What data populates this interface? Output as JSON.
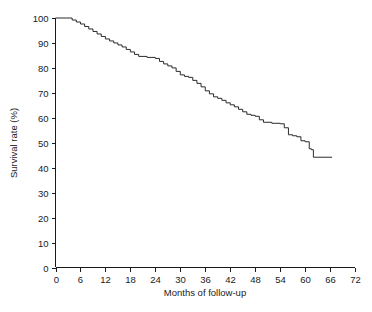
{
  "chart_data": {
    "type": "line",
    "title": "",
    "subtitle": "",
    "xlabel": "Months of follow-up",
    "ylabel": "Survival rate (%)",
    "xlim": [
      0,
      72
    ],
    "ylim": [
      0,
      100
    ],
    "xticks": [
      0,
      6,
      12,
      18,
      24,
      30,
      36,
      42,
      48,
      54,
      60,
      66,
      72
    ],
    "yticks": [
      0,
      10,
      20,
      30,
      40,
      50,
      60,
      70,
      80,
      90,
      100
    ],
    "xtick_labels": [
      "0",
      "6",
      "12",
      "18",
      "24",
      "30",
      "36",
      "42",
      "48",
      "54",
      "60",
      "66",
      "72"
    ],
    "ytick_labels": [
      "0",
      "10",
      "20",
      "30",
      "40",
      "50",
      "60",
      "70",
      "80",
      "90",
      "100"
    ],
    "grid": false,
    "legend": false,
    "legend_position": "none",
    "line_color": "#2b2b2b",
    "background_color": "#ffffff",
    "step_style": "post",
    "series": [
      {
        "name": "Survival",
        "x": [
          0,
          2.5,
          4,
          5,
          6,
          7,
          8,
          9,
          10,
          11,
          12,
          13,
          14,
          15,
          16,
          17,
          18,
          19,
          20,
          22,
          24,
          25,
          26,
          27,
          28,
          29,
          30,
          31,
          32,
          33,
          34,
          35,
          36,
          37,
          38,
          39,
          40,
          41,
          42,
          43,
          44,
          45,
          46,
          47,
          48,
          49,
          50,
          52,
          54,
          55,
          56,
          57,
          58,
          59,
          60,
          61,
          61.5,
          62,
          66.5
        ],
        "y": [
          100,
          100,
          99.2,
          98.4,
          97.6,
          96.6,
          95.6,
          94.6,
          93.6,
          92.6,
          91.6,
          90.8,
          90.0,
          89.2,
          88.4,
          87.4,
          86.4,
          85.4,
          84.6,
          84.2,
          83.8,
          82.6,
          81.6,
          80.8,
          80.0,
          78.6,
          77.2,
          76.6,
          76.2,
          75.0,
          73.8,
          72.4,
          70.8,
          69.6,
          68.4,
          67.8,
          67.0,
          66.0,
          65.2,
          64.4,
          63.4,
          62.4,
          61.4,
          61.0,
          60.6,
          59.2,
          58.2,
          57.8,
          57.6,
          56.0,
          53.2,
          52.8,
          52.4,
          50.8,
          50.4,
          47.6,
          47.2,
          44.2,
          44.2
        ]
      }
    ]
  },
  "axes": {
    "y_axis_title": "Survival rate (%)",
    "x_axis_title": "Months of follow-up"
  }
}
